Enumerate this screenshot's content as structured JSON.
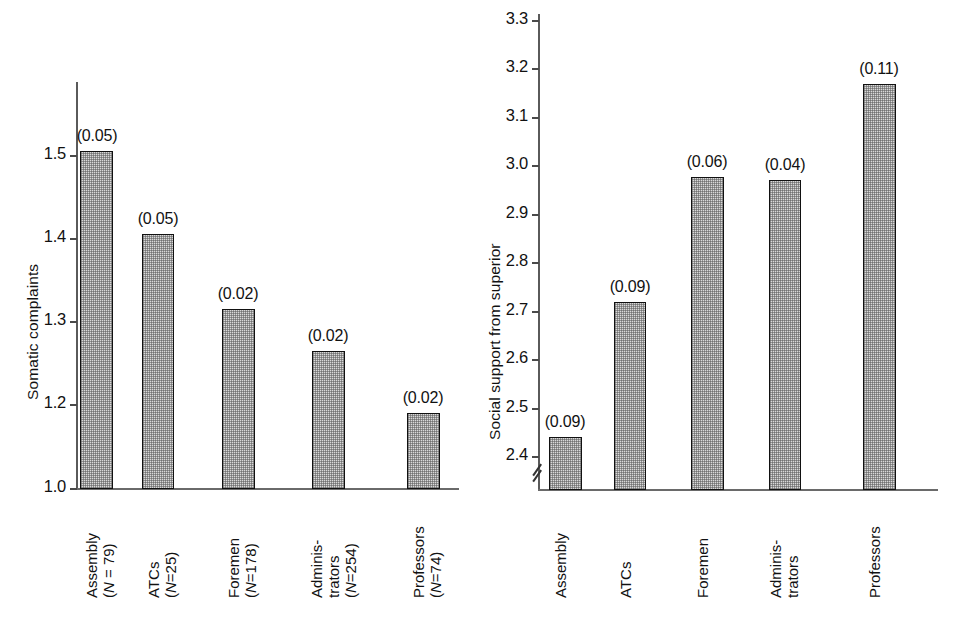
{
  "figure": {
    "background": "#ffffff",
    "bar_fill": "#d9d9d9",
    "bar_edge": "#111111",
    "axis_color": "#5a5a5a"
  },
  "chart_data": [
    {
      "type": "bar",
      "id": "somatic-complaints",
      "title": "",
      "xlabel": "",
      "ylabel": "Somatic complaints",
      "ylim": [
        1.0,
        1.55
      ],
      "yticks": [
        "1.0",
        "1.2",
        "1.3",
        "1.4",
        "1.5"
      ],
      "ytick_values": [
        1.0,
        1.2,
        1.3,
        1.4,
        1.5
      ],
      "grid": false,
      "legend": "none",
      "axis_break": false,
      "categories": [
        "Assembly",
        "ATCs",
        "Foremen",
        "Adminis-trators",
        "Professors"
      ],
      "category_lines": [
        [
          "Assembly",
          "(N = 79)"
        ],
        [
          "ATCs",
          "(N=25)"
        ],
        [
          "Foremen",
          "(N=178)"
        ],
        [
          "Adminis-",
          "trators",
          "(N=254)"
        ],
        [
          "Professors",
          "(N=74)"
        ]
      ],
      "n_values": [
        79,
        25,
        178,
        254,
        74
      ],
      "values": [
        1.51,
        1.41,
        1.32,
        1.25,
        1.19
      ],
      "error_labels": [
        "(0.05)",
        "(0.05)",
        "(0.02)",
        "(0.02)",
        "(0.02)"
      ],
      "errors": [
        0.05,
        0.05,
        0.02,
        0.02,
        0.02
      ]
    },
    {
      "type": "bar",
      "id": "social-support",
      "title": "",
      "xlabel": "",
      "ylabel": "Social support from superior",
      "ylim": [
        2.35,
        3.33
      ],
      "yticks": [
        "2.4",
        "2.5",
        "2.6",
        "2.7",
        "2.8",
        "2.9",
        "3.0",
        "3.1",
        "3.2",
        "3.3"
      ],
      "ytick_values": [
        2.4,
        2.5,
        2.6,
        2.7,
        2.8,
        2.9,
        3.0,
        3.1,
        3.2,
        3.3
      ],
      "grid": false,
      "legend": "none",
      "axis_break": true,
      "categories": [
        "Assembly",
        "ATCs",
        "Foremen",
        "Adminis-trators",
        "Professors"
      ],
      "category_lines": [
        [
          "Assembly"
        ],
        [
          "ATCs"
        ],
        [
          "Foremen"
        ],
        [
          "Adminis-",
          "trators"
        ],
        [
          "Professors"
        ]
      ],
      "values": [
        2.44,
        2.72,
        2.98,
        2.975,
        3.17
      ],
      "error_labels": [
        "(0.09)",
        "(0.09)",
        "(0.06)",
        "(0.04)",
        "(0.11)"
      ],
      "errors": [
        0.09,
        0.09,
        0.06,
        0.04,
        0.11
      ]
    }
  ],
  "left": {
    "ylabel": "Somatic complaints",
    "ticks": [
      {
        "label": "1.5"
      },
      {
        "label": "1.4"
      },
      {
        "label": "1.3"
      },
      {
        "label": "1.2"
      },
      {
        "label": "1.0"
      }
    ],
    "bars": [
      {
        "err": "(0.05)",
        "cat1": "Assembly",
        "cat2": "(N = 79)"
      },
      {
        "err": "(0.05)",
        "cat1": "ATCs",
        "cat2": "(N=25)"
      },
      {
        "err": "(0.02)",
        "cat1": "Foremen",
        "cat2": "(N=178)"
      },
      {
        "err": "(0.02)",
        "cat1": "Adminis-",
        "cat2": "trators",
        "cat3": "(N=254)"
      },
      {
        "err": "(0.02)",
        "cat1": "Professors",
        "cat2": "(N=74)"
      }
    ]
  },
  "right": {
    "ylabel": "Social support from superior",
    "ticks": [
      {
        "label": "3.3"
      },
      {
        "label": "3.2"
      },
      {
        "label": "3.1"
      },
      {
        "label": "3.0"
      },
      {
        "label": "2.9"
      },
      {
        "label": "2.8"
      },
      {
        "label": "2.7"
      },
      {
        "label": "2.6"
      },
      {
        "label": "2.5"
      },
      {
        "label": "2.4"
      }
    ],
    "bars": [
      {
        "err": "(0.09)",
        "cat1": "Assembly"
      },
      {
        "err": "(0.09)",
        "cat1": "ATCs"
      },
      {
        "err": "(0.06)",
        "cat1": "Foremen"
      },
      {
        "err": "(0.04)",
        "cat1": "Adminis-",
        "cat2": "trators"
      },
      {
        "err": "(0.11)",
        "cat1": "Professors"
      }
    ]
  }
}
